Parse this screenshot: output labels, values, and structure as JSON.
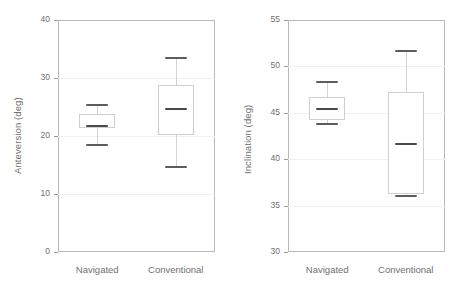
{
  "figure": {
    "panels": [
      {
        "id": "anteversion",
        "ylabel": "Anteversion (deg)",
        "yticks": [
          "0",
          "10",
          "20",
          "30",
          "40"
        ],
        "categories": [
          "Navigated",
          "Conventional"
        ]
      },
      {
        "id": "inclination",
        "ylabel": "Inclination (deg)",
        "yticks": [
          "30",
          "35",
          "40",
          "45",
          "50",
          "55"
        ],
        "categories": [
          "Navigated",
          "Conventional"
        ]
      }
    ]
  },
  "chart_data": [
    {
      "type": "box",
      "title": "",
      "xlabel": "",
      "ylabel": "Anteversion (deg)",
      "ylim": [
        0,
        40
      ],
      "ytick_values": [
        0,
        10,
        20,
        30,
        40
      ],
      "grid": true,
      "legend": "none",
      "categories": [
        "Navigated",
        "Conventional"
      ],
      "boxes": [
        {
          "name": "Navigated",
          "whisker_low": 18.4,
          "q1": 21.3,
          "median": 21.8,
          "q3": 23.8,
          "whisker_high": 25.4
        },
        {
          "name": "Conventional",
          "whisker_low": 14.6,
          "q1": 20.2,
          "median": 24.7,
          "q3": 28.8,
          "whisker_high": 33.4
        }
      ]
    },
    {
      "type": "box",
      "title": "",
      "xlabel": "",
      "ylabel": "Inclination (deg)",
      "ylim": [
        30,
        55
      ],
      "ytick_values": [
        30,
        35,
        40,
        45,
        50,
        55
      ],
      "grid": true,
      "legend": "none",
      "categories": [
        "Navigated",
        "Conventional"
      ],
      "boxes": [
        {
          "name": "Navigated",
          "whisker_low": 43.8,
          "q1": 44.2,
          "median": 45.4,
          "q3": 46.7,
          "whisker_high": 48.3
        },
        {
          "name": "Conventional",
          "whisker_low": 36.0,
          "q1": 36.2,
          "median": 41.6,
          "q3": 47.2,
          "whisker_high": 51.7
        }
      ]
    }
  ],
  "colors": {
    "frame": "#b9b9b9",
    "grid": "#f0f0f0",
    "box_outline": "#cfcfcf",
    "whisker": "#d3d3d3",
    "cap": "#5c5c5c",
    "median": "#4a4a4a",
    "text": "#6f6f6f",
    "background": "#ffffff"
  }
}
